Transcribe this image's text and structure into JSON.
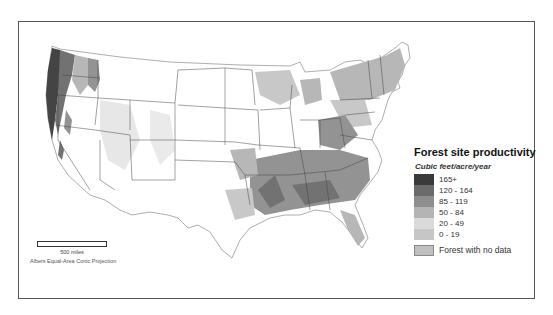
{
  "map": {
    "title": "Forest site productivity",
    "projection": "Albers Equal-Area Conic Projection",
    "scale": {
      "label": "500 miles"
    }
  },
  "legend": {
    "title": "Forest site productivity",
    "subtitle": "Cubic feet/acre/year",
    "classes": [
      {
        "label": "165+",
        "color": "#3a3a3a"
      },
      {
        "label": "120 - 164",
        "color": "#6b6b6b"
      },
      {
        "label": "85 - 119",
        "color": "#8e8e8e"
      },
      {
        "label": "50 - 84",
        "color": "#b4b4b4"
      },
      {
        "label": "20 - 49",
        "color": "#dadada"
      },
      {
        "label": "0 - 19",
        "color": "#c6c6c6"
      }
    ],
    "no_data": {
      "label": "Forest with no data",
      "color": "#c0c0c0"
    }
  }
}
